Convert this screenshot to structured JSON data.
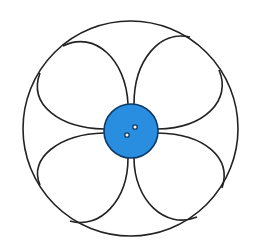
{
  "diagram": {
    "colors": {
      "background": "#ffffff",
      "stroke": "#222222",
      "center_fill": "#2a8ee0",
      "center_stroke": "#0d3a66",
      "hole_fill": "#ffffff"
    },
    "outer_circle": {
      "cx": 130.5,
      "cy": 128.5,
      "r": 107.5
    },
    "center_disc": {
      "cx": 131,
      "cy": 131,
      "r": 27
    },
    "holes": [
      {
        "cx": 127,
        "cy": 135,
        "r": 2.2
      },
      {
        "cx": 135,
        "cy": 127,
        "r": 2.2
      }
    ],
    "arcs": [
      {
        "name": "arc-top-left-upper",
        "d": "M63,46 C95,30 126,60 128,104"
      },
      {
        "name": "arc-top-left-lower",
        "d": "M40,73 C28,105 60,128 104,129"
      },
      {
        "name": "arc-top-right-upper",
        "d": "M190,37 C160,30 134,60 134,104"
      },
      {
        "name": "arc-top-right-lower",
        "d": "M219,70 C232,100 205,128 158,129"
      },
      {
        "name": "arc-bottom-left-upper",
        "d": "M40,185 C28,158 60,134 104,133"
      },
      {
        "name": "arc-bottom-left-lower",
        "d": "M70,221 C100,230 128,200 128,158"
      },
      {
        "name": "arc-bottom-right-upper",
        "d": "M222,188 C232,158 205,134 158,133"
      },
      {
        "name": "arc-bottom-right-lower",
        "d": "M197,217 C165,230 134,200 134,158"
      }
    ]
  }
}
